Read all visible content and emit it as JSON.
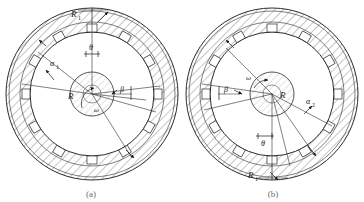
{
  "figure": {
    "panels": [
      {
        "id": "a",
        "caption": "(a)",
        "labels": {
          "outer_radius": "R",
          "outer_radius_sub": "1",
          "hub_radius": "R",
          "alpha": "α",
          "alpha_sub": "1",
          "beta": "β",
          "theta": "θ",
          "omega": "ω"
        }
      },
      {
        "id": "b",
        "caption": "(b)",
        "labels": {
          "outer_radius": "R",
          "outer_radius_sub": "1",
          "hub_radius": "R",
          "alpha": "α",
          "alpha_sub": "2",
          "beta": "β",
          "theta": "θ",
          "omega": "ω"
        }
      }
    ],
    "geometry": {
      "ring_outer_radius": 86,
      "ring_inner_radius": 72,
      "bore_radius": 62,
      "hub_radius": 22,
      "block_count": 12,
      "block_width": 9,
      "block_height": 7
    },
    "colors": {
      "line": "#2b2b2b",
      "hatch": "#5a5a5a",
      "hub_hatch": "#8f8f8f",
      "caption": "#6b6b6b",
      "background": "#ffffff"
    }
  }
}
